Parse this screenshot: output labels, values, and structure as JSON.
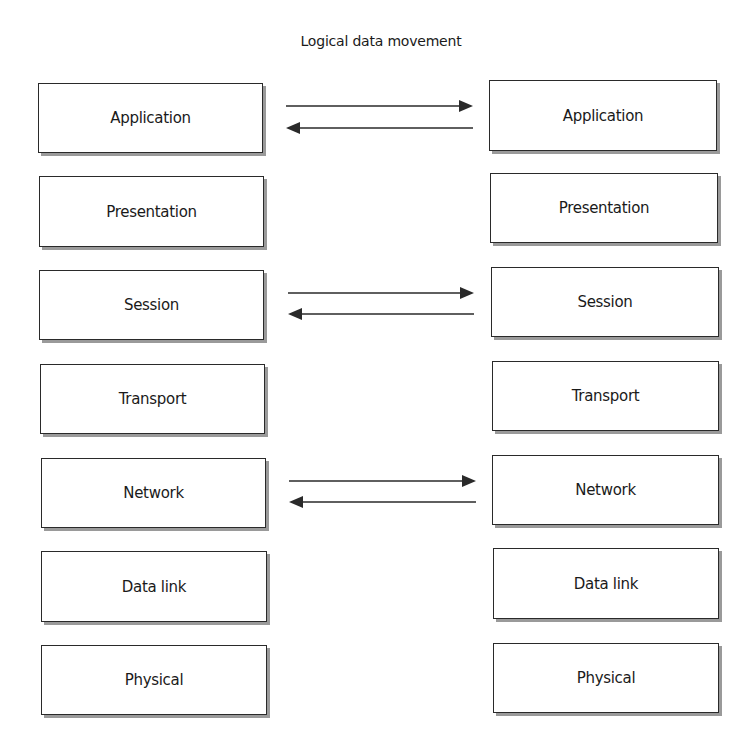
{
  "title": "Logical data movement",
  "left_stack": {
    "layers": [
      {
        "label": "Application",
        "x": 38,
        "y": 83,
        "w": 225,
        "h": 70
      },
      {
        "label": "Presentation",
        "x": 39,
        "y": 176,
        "w": 225,
        "h": 71
      },
      {
        "label": "Session",
        "x": 39,
        "y": 270,
        "w": 225,
        "h": 70
      },
      {
        "label": "Transport",
        "x": 40,
        "y": 364,
        "w": 225,
        "h": 70
      },
      {
        "label": "Network",
        "x": 41,
        "y": 458,
        "w": 225,
        "h": 70
      },
      {
        "label": "Data link",
        "x": 41,
        "y": 551,
        "w": 226,
        "h": 71
      },
      {
        "label": "Physical",
        "x": 41,
        "y": 645,
        "w": 226,
        "h": 70
      }
    ]
  },
  "right_stack": {
    "layers": [
      {
        "label": "Application",
        "x": 489,
        "y": 80,
        "w": 228,
        "h": 71
      },
      {
        "label": "Presentation",
        "x": 490,
        "y": 173,
        "w": 228,
        "h": 70
      },
      {
        "label": "Session",
        "x": 491,
        "y": 267,
        "w": 228,
        "h": 70
      },
      {
        "label": "Transport",
        "x": 492,
        "y": 361,
        "w": 227,
        "h": 70
      },
      {
        "label": "Network",
        "x": 492,
        "y": 455,
        "w": 227,
        "h": 70
      },
      {
        "label": "Data link",
        "x": 493,
        "y": 548,
        "w": 226,
        "h": 71
      },
      {
        "label": "Physical",
        "x": 493,
        "y": 643,
        "w": 226,
        "h": 70
      }
    ]
  },
  "arrow_pairs": [
    {
      "connects": "Application",
      "forward_y": 106,
      "back_y": 128,
      "x1": 286,
      "x2": 473
    },
    {
      "connects": "Session",
      "forward_y": 293,
      "back_y": 314,
      "x1": 288,
      "x2": 474
    },
    {
      "connects": "Network",
      "forward_y": 481,
      "back_y": 502,
      "x1": 289,
      "x2": 476
    }
  ],
  "colors": {
    "line": "#2a2a2a",
    "shadow": "#9a9a9a",
    "background": "#ffffff"
  }
}
